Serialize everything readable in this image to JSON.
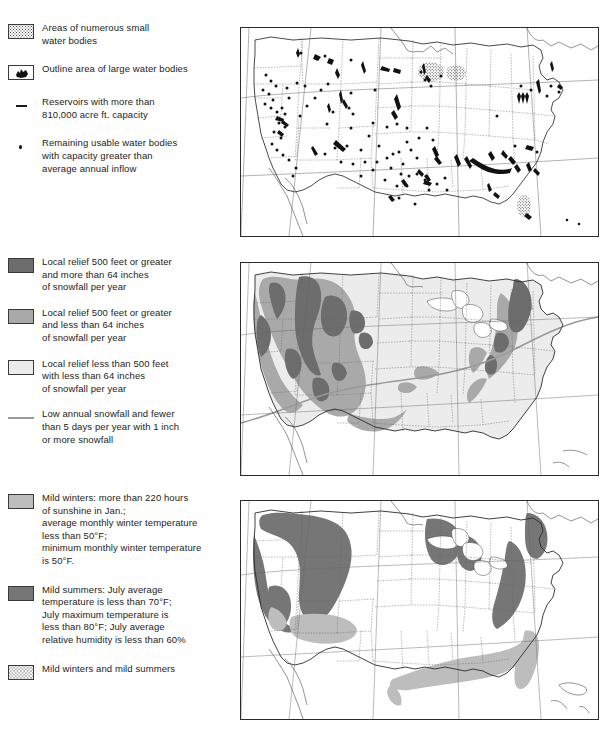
{
  "legends": {
    "water": {
      "title_hidden": "",
      "items": [
        {
          "swatch": "stipple-box",
          "icon_name": "stipple-swatch",
          "lines": [
            "Areas of numerous small",
            "water bodies"
          ]
        },
        {
          "swatch": "lake-outline-box",
          "icon_name": "lake-outline-swatch",
          "lines": [
            "Outline area of large water bodies"
          ]
        },
        {
          "swatch": "dash",
          "icon_name": "dash-swatch",
          "lines": [
            "Reservoirs with more than",
            "810,000 acre ft. capacity"
          ]
        },
        {
          "swatch": "dot",
          "icon_name": "dot-swatch",
          "lines": [
            "Remaining usable water bodies",
            "with capacity greater than",
            "average annual inflow"
          ]
        }
      ]
    },
    "relief": {
      "items": [
        {
          "swatch": "dark-gray",
          "icon_name": "dark-gray-swatch",
          "color": "#6d6d6d",
          "lines": [
            "Local relief 500 feet or greater",
            "and more than 64 inches",
            "of snowfall per year"
          ]
        },
        {
          "swatch": "mid-gray",
          "icon_name": "mid-gray-swatch",
          "color": "#a9a9a9",
          "lines": [
            "Local relief 500 feet or greater",
            "and less than 64 inches",
            "of snowfall per year"
          ]
        },
        {
          "swatch": "pale-gray",
          "icon_name": "pale-gray-swatch",
          "color": "#ececec",
          "lines": [
            "Local relief less than 500 feet",
            "with less than 64 inches",
            "of snowfall per year"
          ]
        },
        {
          "swatch": "gray-line",
          "icon_name": "gray-line-swatch",
          "color": "#9a9a9a",
          "lines": [
            "Low annual snowfall and fewer",
            "than 5 days per year with 1 inch",
            "or more snowfall"
          ]
        }
      ]
    },
    "climate": {
      "items": [
        {
          "swatch": "light-gray",
          "icon_name": "light-gray-swatch",
          "color": "#bdbdbd",
          "lines": [
            "Mild winters: more than 220 hours",
            "of sunshine in Jan.;",
            "average monthly winter temperature",
            "less than 50°F;",
            "minimum monthly winter temperature",
            "is 50°F."
          ]
        },
        {
          "swatch": "dark-gray",
          "icon_name": "dark-gray-swatch",
          "color": "#767676",
          "lines": [
            "Mild summers: July average",
            "temperature is less than 70°F;",
            "July maximum temperature is",
            "less than 80°F; July average",
            "relative humidity is less than 60%"
          ]
        },
        {
          "swatch": "stipple",
          "icon_name": "stipple-swatch",
          "lines": [
            "Mild winters and mild summers"
          ]
        }
      ]
    }
  },
  "maps": [
    {
      "name": "water-bodies-map",
      "subject": "Usable water bodies, reservoirs and areas of numerous small water bodies of the conterminous United States",
      "features": [
        "state-boundaries",
        "coastline",
        "graticule",
        "reservoir-dashes",
        "water-body-dots",
        "stippled-lake-districts"
      ]
    },
    {
      "name": "relief-snowfall-map",
      "subject": "Local relief and annual snowfall classes of the conterminous United States",
      "features": [
        "state-boundaries",
        "coastline",
        "graticule",
        "relief-500ft-high-snow",
        "relief-500ft-low-snow",
        "relief-under-500ft",
        "low-snowfall-line"
      ]
    },
    {
      "name": "mild-climate-map",
      "subject": "Areas of mild winters, mild summers and both of the conterminous United States",
      "features": [
        "state-boundaries",
        "coastline",
        "graticule",
        "mild-winters-area",
        "mild-summers-area",
        "mild-winters-and-summers-area"
      ]
    }
  ],
  "colors": {
    "dark_gray": "#6d6d6d",
    "mid_gray": "#a9a9a9",
    "pale_gray": "#ececec",
    "mild_winter_gray": "#bdbdbd",
    "mild_summer_gray": "#767676",
    "line_gray": "#9a9a9a",
    "ink": "#1a1a1a"
  }
}
